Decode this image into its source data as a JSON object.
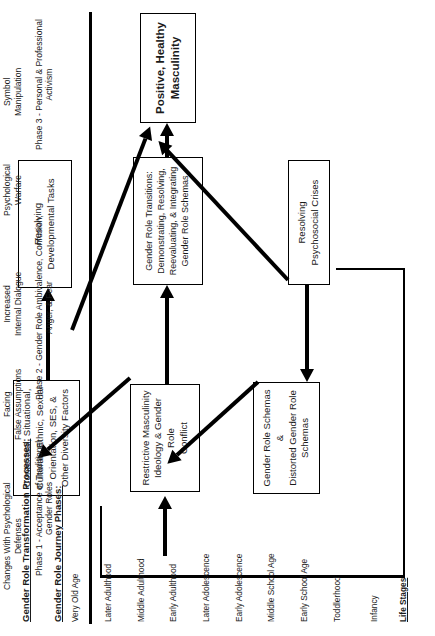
{
  "boxes": {
    "positive_healthy_masculinity": "Positive, Healthy\nMasculinity",
    "resolving_developmental_tasks": "Resolving\nDevelopmental Tasks",
    "gender_role_transitions": "Gender Role Transitions:\nDemonstrating, Resolving,\nReevaluating, & Integrating\nGender Role Schemas",
    "resolving_psychosocial_crises": "Resolving\nPsychosocial Crises",
    "contextual_factors": "Contextual, Situational,\nCultural , Ethnic, Sexual\nOrientation, SES, &\nOther Diversity Factors",
    "restrictive_masculinity": "Restrictive Masculinity\nIdeology & Gender Role\nConflict",
    "gender_role_schemas": "Gender Role Schemas &\nDistorted Gender Role\nSchemas"
  },
  "life_stages": {
    "header": "Life Stages",
    "items": [
      "Infancy",
      "Toddlerhood",
      "Early School Age",
      "Middle School Age",
      "Early Adolescence",
      "Later Adolescence",
      "Early Adulthood",
      "Middle Adulthood",
      "Later Adulthood",
      "Very Old Age"
    ]
  },
  "legend": {
    "journey_title": "Gender Role Journey Phases:",
    "phases": [
      "Phase 1 - Acceptance of Traditional\nGender Roles",
      "Phase 2 - Gender Role Ambivalence, Confusion,\nAnger, & Fear",
      "Phase 3 - Personal & Professional\nActivism"
    ],
    "phase_labels": [
      "Phase 1",
      "Phase 2",
      "Phase 3"
    ],
    "processes_title": "Gender Role Transformation Processes:",
    "processes": [
      "Changes  With Psychological\nDefenses",
      "Facing\nFalse Assumptions",
      "Increased\nInternal Dialogue",
      "Psychological\nWarfare",
      "Symbol\nManipulation"
    ]
  },
  "colors": {
    "ink": "#000000",
    "text": "#1a1a1a",
    "background": "#ffffff"
  }
}
